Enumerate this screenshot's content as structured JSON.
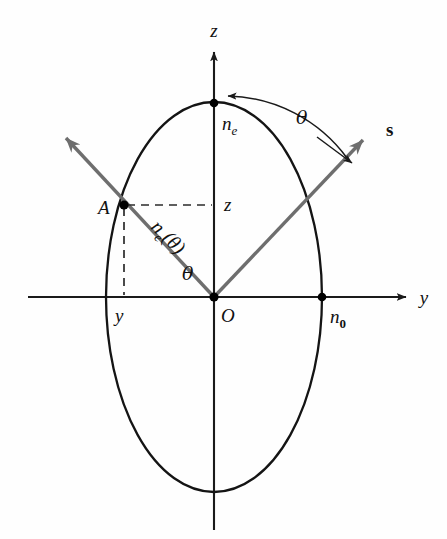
{
  "figure": {
    "background_color": "#fefefe",
    "curve_color": "#141414",
    "ray_color": "#6e6e6e",
    "axis_color": "#1a1a1a",
    "dash_color": "#2b2b2b"
  },
  "axes": {
    "vertical": {
      "label": "z",
      "label_x": 214,
      "label_y": 30,
      "x": 214,
      "y_top": 48,
      "y_bottom": 530
    },
    "horizontal": {
      "label": "y",
      "label_x": 424,
      "label_y": 303,
      "y": 297,
      "x_left": 28,
      "x_right": 410
    },
    "origin": {
      "label": "O",
      "x": 214,
      "y": 297,
      "label_x": 221,
      "label_y": 320
    }
  },
  "ellipse": {
    "center_x": 214,
    "center_y": 297,
    "rx": 108,
    "ry": 195
  },
  "vertices": [
    {
      "name": "extraordinary-index-vertex",
      "label": "n",
      "subscript": "e",
      "subscript_style": "italic",
      "x": 214,
      "y": 103,
      "label_x": 222,
      "label_y": 128
    },
    {
      "name": "ordinary-index-vertex",
      "label": "n",
      "subscript": "0",
      "subscript_style": "upright",
      "x": 322,
      "y": 297,
      "label_x": 330,
      "label_y": 321
    }
  ],
  "point_a": {
    "label": "A",
    "x": 124,
    "y": 205,
    "label_x": 100,
    "label_y": 213
  },
  "rays": [
    {
      "name": "optic-ray-left",
      "x1": 214,
      "y1": 297,
      "x2": 57,
      "y2": 128,
      "has_arrowhead": true,
      "label": ""
    },
    {
      "name": "poynting-vector-s",
      "x1": 214,
      "y1": 297,
      "x2": 372,
      "y2": 130,
      "has_arrowhead": true,
      "label": "s",
      "label_x": 390,
      "label_y": 130
    }
  ],
  "dashed_guides": [
    {
      "name": "z-projection-guide",
      "x1": 124,
      "y1": 205,
      "x2": 214,
      "y2": 205
    },
    {
      "name": "y-projection-guide",
      "x1": 124,
      "y1": 205,
      "x2": 124,
      "y2": 297
    }
  ],
  "guide_labels": [
    {
      "name": "z-component-label",
      "text": "z",
      "x": 225,
      "y": 210
    },
    {
      "name": "y-component-label",
      "text": "y",
      "x": 119,
      "y": 321
    }
  ],
  "angle_labels": [
    {
      "name": "theta-upper-label",
      "text": "θ",
      "x": 300,
      "y": 118
    },
    {
      "name": "theta-lower-label",
      "text": "θ",
      "x": 189,
      "y": 274
    }
  ],
  "radius_label": {
    "name": "ne-theta-label",
    "base": "n",
    "subscript": "e",
    "argument": "(θ)",
    "full_text": "n_e(θ)",
    "x": 168,
    "y": 249,
    "rotation": 45
  },
  "arc": {
    "name": "theta-arc-upper",
    "start_x": 226,
    "start_y": 96,
    "end_x": 344,
    "end_y": 155,
    "radius": 140
  }
}
